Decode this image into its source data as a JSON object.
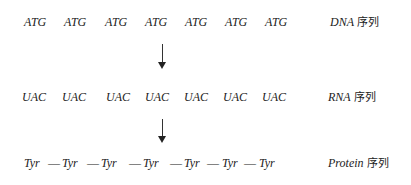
{
  "dna": {
    "codons": [
      "ATG",
      "ATG",
      "ATG",
      "ATG",
      "ATG",
      "ATG",
      "ATG"
    ],
    "label_en": "DNA",
    "label_zh": "序列"
  },
  "rna": {
    "codons": [
      "UAC",
      "UAC",
      "UAC",
      "UAC",
      "UAC",
      "UAC",
      "UAC"
    ],
    "label_en": "RNA",
    "label_zh": "序列"
  },
  "protein": {
    "residues": [
      "Tyr",
      "Tyr",
      "Tyr",
      "Tyr",
      "Tyr",
      "Tyr",
      "Tyr"
    ],
    "bond": "—",
    "label_en": "Protein",
    "label_zh": "序列"
  },
  "arrows": [
    {
      "name": "transcription",
      "from": "DNA",
      "to": "RNA"
    },
    {
      "name": "translation",
      "from": "RNA",
      "to": "Protein"
    }
  ]
}
